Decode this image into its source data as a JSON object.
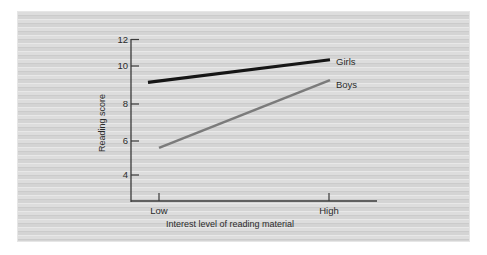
{
  "chart_data": {
    "type": "line",
    "title": "",
    "xlabel": "Interest level of reading material",
    "ylabel": "Reading score",
    "categories": [
      "Low",
      "High"
    ],
    "x_tick_labels": [
      "Low",
      "High"
    ],
    "y_tick_labels": [
      "12",
      "10",
      "8",
      "6",
      "4"
    ],
    "y_ticks": [
      12,
      10,
      8,
      6,
      4
    ],
    "ylim": [
      3,
      12
    ],
    "grid": false,
    "legend_position": "inline-right-end",
    "series": [
      {
        "name": "Girls",
        "values": [
          9.4,
          10.8
        ],
        "color": "#151515",
        "label": "Girls"
      },
      {
        "name": "Boys",
        "values": [
          5.6,
          9.6
        ],
        "color": "#7b7b7b",
        "label": "Boys"
      }
    ]
  },
  "axes": {
    "y_label": "Reading score",
    "x_label": "Interest level of reading material",
    "y_tick_0": "12",
    "y_tick_1": "10",
    "y_tick_2": "8",
    "y_tick_3": "6",
    "y_tick_4": "4",
    "x_tick_0": "Low",
    "x_tick_1": "High"
  },
  "legend": {
    "girls": "Girls",
    "boys": "Boys"
  }
}
